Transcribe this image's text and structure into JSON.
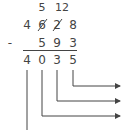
{
  "problem": {
    "borrow": {
      "tens_over_hundreds": "5",
      "over_tens": "12"
    },
    "minuend": [
      "4",
      "6",
      "2",
      "8"
    ],
    "struck_digits": [
      1,
      2
    ],
    "operator": "-",
    "subtrahend": [
      "5",
      "9",
      "3"
    ],
    "result": [
      "4",
      "0",
      "3",
      "5"
    ]
  },
  "arrows": {
    "count": 3,
    "color": "#444444"
  }
}
